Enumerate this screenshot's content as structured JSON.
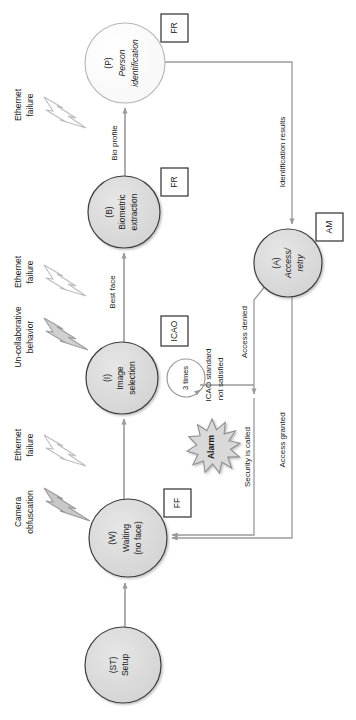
{
  "diagram": {
    "type": "state-machine",
    "orientation": "rotated-90-ccw",
    "nodes": [
      {
        "id": "ST",
        "tag": "(ST)",
        "label": "Setup",
        "label2": "",
        "fill": "#dcdcdc",
        "cx": 123,
        "cy": 665,
        "r": 38
      },
      {
        "id": "W",
        "tag": "(W)",
        "label": "Waiting",
        "label2": "(no face)",
        "fill": "#dcdcdc",
        "cx": 128,
        "cy": 538,
        "r": 39
      },
      {
        "id": "I",
        "tag": "(I)",
        "label": "Image",
        "label2": "selection",
        "fill": "#dcdcdc",
        "cx": 122,
        "cy": 378,
        "r": 36
      },
      {
        "id": "B",
        "tag": "(B)",
        "label": "Biometric",
        "label2": "extraction",
        "fill": "#dcdcdc",
        "cx": 124,
        "cy": 212,
        "r": 36
      },
      {
        "id": "P",
        "tag": "(P)",
        "label": "Person",
        "label2": "identification",
        "fill": "#fcfcfc",
        "cx": 125,
        "cy": 63,
        "r": 40
      },
      {
        "id": "A",
        "tag": "(A)",
        "label": "Access/",
        "label2": "retry",
        "fill": "#dcdcdc",
        "cx": 288,
        "cy": 263,
        "r": 34
      }
    ],
    "annotation_boxes": [
      {
        "id": "fr-person",
        "label": "FR",
        "x": 161,
        "y": 14,
        "w": 27,
        "h": 28
      },
      {
        "id": "fr-biometric",
        "label": "FR",
        "x": 161,
        "y": 168,
        "w": 27,
        "h": 28
      },
      {
        "id": "icao",
        "label": "ICAO",
        "x": 161,
        "y": 316,
        "w": 27,
        "h": 30
      },
      {
        "id": "ff-waiting",
        "label": "FF",
        "x": 164,
        "y": 489,
        "w": 27,
        "h": 28
      },
      {
        "id": "am-access",
        "label": "AM",
        "x": 316,
        "y": 213,
        "w": 27,
        "h": 28
      }
    ],
    "edge_labels": [
      {
        "id": "bio-profile",
        "text": "Bio profile",
        "x": 115,
        "y": 143
      },
      {
        "id": "best-face",
        "text": "Best face",
        "x": 113,
        "y": 290
      },
      {
        "id": "identification-results",
        "text": "Identification results",
        "x": 284,
        "y": 150
      },
      {
        "id": "access-denied",
        "text": "Access denied",
        "x": 246,
        "y": 330
      },
      {
        "id": "access-granted",
        "text": "Access granted",
        "x": 283,
        "y": 440
      },
      {
        "id": "security-is-called",
        "text": "Security is called",
        "x": 249,
        "y": 455
      },
      {
        "id": "icao-not-satisfied-1",
        "text": "ICAO standard",
        "x": 210,
        "y": 373
      },
      {
        "id": "icao-not-satisfied-2",
        "text": "not satisfied",
        "x": 221,
        "y": 375
      }
    ],
    "loop": {
      "id": "retry-loop",
      "label": "3 times",
      "cx": 186,
      "cy": 378,
      "r": 19
    },
    "alarm": {
      "id": "alarm-star",
      "label": "Alarm",
      "cx": 212,
      "cy": 447,
      "r": 28
    },
    "faults": [
      {
        "id": "fault-ethernet-top",
        "line1": "Ethernet",
        "line2": "failure",
        "lx": 20,
        "ly": 105,
        "bx": 62,
        "by": 115,
        "fill": "#ffffff"
      },
      {
        "id": "fault-ethernet-mid",
        "line1": "Ethernet",
        "line2": "failure",
        "lx": 20,
        "ly": 272,
        "bx": 62,
        "by": 282,
        "fill": "#ffffff"
      },
      {
        "id": "fault-uncollaborative",
        "line1": "Un-collaborative",
        "line2": "behavior",
        "lx": 20,
        "ly": 337,
        "bx": 62,
        "by": 340,
        "fill": "#d0d0d0"
      },
      {
        "id": "fault-ethernet-low",
        "line1": "Ethernet",
        "line2": "failure",
        "lx": 20,
        "ly": 445,
        "bx": 62,
        "by": 450,
        "fill": "#ffffff"
      },
      {
        "id": "fault-camera",
        "line1": "Camera",
        "line2": "obfuscation",
        "lx": 20,
        "ly": 512,
        "bx": 62,
        "by": 510,
        "fill": "#c8c8c8"
      }
    ],
    "colors": {
      "node_fill_gray": "#dcdcdc",
      "node_fill_white": "#fcfcfc",
      "node_stroke": "#555555",
      "edge_stroke": "#9a9a9a",
      "text": "#1a1a1a",
      "box_stroke": "#333333",
      "alarm_fill": "#d9d9d9"
    }
  }
}
